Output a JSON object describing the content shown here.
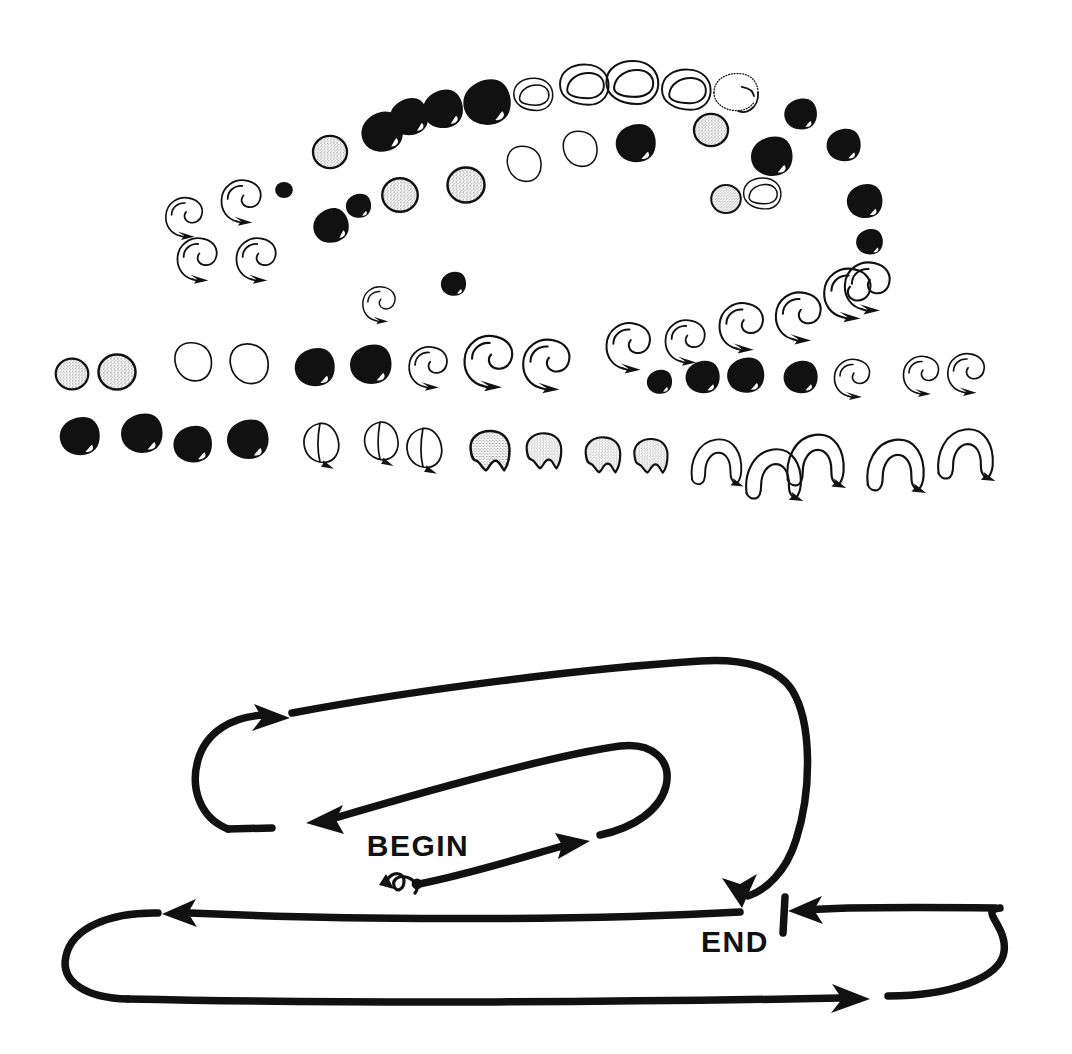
{
  "plate": {
    "title": "Serpentine glyph sequence plate",
    "background_color": "#ffffff",
    "ink_color": "#111111",
    "width": 1072,
    "height": 1054
  },
  "legend": {
    "begin_label": "BEGIN",
    "end_label": "END",
    "end_tick_mark": "|"
  },
  "glyph_kinds": {
    "solid": "solid-ink-blob",
    "stipple": "stippled-circle",
    "outline": "open-outline-blob",
    "crescent": "open-crescent",
    "crescent_dotted": "dotted-outline-crescent",
    "hook": "hook-with-arrow-tail",
    "arch": "open-arch-horseshoe",
    "teardrop": "outlined-teardrop-with-tail",
    "stipple_lobed": "stippled-lobed-blob",
    "dot": "small-solid-dot"
  },
  "chart_data": {
    "type": "scatter",
    "xlabel": "",
    "ylabel": "",
    "xlim": [
      0,
      1072
    ],
    "ylim": [
      0,
      1054
    ],
    "grid": false,
    "legend_position": "none",
    "rows": [
      {
        "row": 1,
        "name": "upper-arc-outer-left-ascending",
        "direction": "left-to-right ascending",
        "glyphs": [
          {
            "x": 183,
            "y": 216,
            "kind": "hook",
            "size": 26,
            "rot": 0
          },
          {
            "x": 196,
            "y": 258,
            "kind": "hook",
            "size": 28,
            "rot": 0
          },
          {
            "x": 240,
            "y": 200,
            "kind": "hook",
            "size": 28,
            "rot": 0
          },
          {
            "x": 255,
            "y": 258,
            "kind": "hook",
            "size": 28,
            "rot": 0
          },
          {
            "x": 284,
            "y": 190,
            "kind": "dot",
            "size": 13,
            "rot": 0
          },
          {
            "x": 330,
            "y": 152,
            "kind": "stipple",
            "size": 23,
            "rot": 0
          },
          {
            "x": 381,
            "y": 131,
            "kind": "solid",
            "size": 28,
            "rot": -12
          },
          {
            "x": 408,
            "y": 116,
            "kind": "solid",
            "size": 26,
            "rot": -10
          },
          {
            "x": 442,
            "y": 108,
            "kind": "solid",
            "size": 27,
            "rot": -8
          },
          {
            "x": 486,
            "y": 101,
            "kind": "solid",
            "size": 32,
            "rot": -5
          },
          {
            "x": 533,
            "y": 97,
            "kind": "crescent",
            "size": 24,
            "rot": 0
          },
          {
            "x": 584,
            "y": 88,
            "kind": "crescent",
            "size": 30,
            "rot": 0
          },
          {
            "x": 632,
            "y": 86,
            "kind": "crescent",
            "size": 32,
            "rot": 0
          },
          {
            "x": 686,
            "y": 93,
            "kind": "crescent",
            "size": 30,
            "rot": 0
          },
          {
            "x": 736,
            "y": 95,
            "kind": "crescent_dotted",
            "size": 29,
            "rot": 0
          },
          {
            "x": 800,
            "y": 113,
            "kind": "solid",
            "size": 22,
            "rot": 0
          },
          {
            "x": 843,
            "y": 144,
            "kind": "solid",
            "size": 23,
            "rot": 0
          },
          {
            "x": 864,
            "y": 200,
            "kind": "solid",
            "size": 24,
            "rot": 0
          },
          {
            "x": 869,
            "y": 241,
            "kind": "solid",
            "size": 18,
            "rot": 0
          },
          {
            "x": 866,
            "y": 285,
            "kind": "hook",
            "size": 32,
            "rot": 0
          }
        ]
      },
      {
        "row": 2,
        "name": "upper-arc-inner-left-ascending",
        "direction": "left-to-right ascending",
        "glyphs": [
          {
            "x": 330,
            "y": 225,
            "kind": "solid",
            "size": 24,
            "rot": -15
          },
          {
            "x": 358,
            "y": 205,
            "kind": "solid",
            "size": 17,
            "rot": 0
          },
          {
            "x": 400,
            "y": 195,
            "kind": "stipple",
            "size": 24,
            "rot": 0
          },
          {
            "x": 466,
            "y": 185,
            "kind": "stipple",
            "size": 25,
            "rot": 0
          },
          {
            "x": 524,
            "y": 164,
            "kind": "outline",
            "size": 24,
            "rot": 0
          },
          {
            "x": 580,
            "y": 149,
            "kind": "outline",
            "size": 24,
            "rot": 0
          },
          {
            "x": 635,
            "y": 142,
            "kind": "solid",
            "size": 27,
            "rot": 0
          },
          {
            "x": 711,
            "y": 130,
            "kind": "stipple",
            "size": 23,
            "rot": 0
          },
          {
            "x": 771,
            "y": 155,
            "kind": "solid",
            "size": 28,
            "rot": 0
          },
          {
            "x": 726,
            "y": 199,
            "kind": "stipple",
            "size": 20,
            "rot": 0
          },
          {
            "x": 762,
            "y": 196,
            "kind": "crescent",
            "size": 23,
            "rot": 0
          }
        ]
      },
      {
        "row": 3,
        "name": "middle-descending-left",
        "direction": "right-to-left descending",
        "glyphs": [
          {
            "x": 453,
            "y": 283,
            "kind": "solid",
            "size": 17,
            "rot": 0
          },
          {
            "x": 378,
            "y": 303,
            "kind": "hook",
            "size": 23,
            "rot": 0
          }
        ]
      },
      {
        "row": 4,
        "name": "middle-row-right-to-left-upper",
        "direction": "left-to-right",
        "glyphs": [
          {
            "x": 72,
            "y": 374,
            "kind": "stipple",
            "size": 22,
            "rot": 0
          },
          {
            "x": 117,
            "y": 372,
            "kind": "stipple",
            "size": 25,
            "rot": 0
          },
          {
            "x": 193,
            "y": 362,
            "kind": "outline",
            "size": 26,
            "rot": 0
          },
          {
            "x": 249,
            "y": 364,
            "kind": "outline",
            "size": 27,
            "rot": 0
          },
          {
            "x": 314,
            "y": 366,
            "kind": "solid",
            "size": 27,
            "rot": 0
          },
          {
            "x": 370,
            "y": 363,
            "kind": "solid",
            "size": 28,
            "rot": 0
          },
          {
            "x": 427,
            "y": 366,
            "kind": "hook",
            "size": 27,
            "rot": 0
          },
          {
            "x": 487,
            "y": 360,
            "kind": "hook",
            "size": 34,
            "rot": 0
          },
          {
            "x": 545,
            "y": 363,
            "kind": "hook",
            "size": 33,
            "rot": 0
          },
          {
            "x": 627,
            "y": 345,
            "kind": "hook",
            "size": 31,
            "rot": 0
          },
          {
            "x": 684,
            "y": 340,
            "kind": "hook",
            "size": 28,
            "rot": 0
          },
          {
            "x": 740,
            "y": 325,
            "kind": "hook",
            "size": 31,
            "rot": 0
          },
          {
            "x": 797,
            "y": 315,
            "kind": "hook",
            "size": 32,
            "rot": 0
          },
          {
            "x": 846,
            "y": 292,
            "kind": "hook",
            "size": 33,
            "rot": 0
          }
        ]
      },
      {
        "row": 5,
        "name": "middle-row-right-segment",
        "direction": "left-to-right",
        "glyphs": [
          {
            "x": 659,
            "y": 381,
            "kind": "solid",
            "size": 17,
            "rot": 0
          },
          {
            "x": 702,
            "y": 376,
            "kind": "solid",
            "size": 23,
            "rot": 0
          },
          {
            "x": 745,
            "y": 374,
            "kind": "solid",
            "size": 25,
            "rot": 0
          },
          {
            "x": 800,
            "y": 376,
            "kind": "solid",
            "size": 23,
            "rot": 0
          },
          {
            "x": 851,
            "y": 377,
            "kind": "hook",
            "size": 25,
            "rot": 0
          },
          {
            "x": 920,
            "y": 374,
            "kind": "hook",
            "size": 25,
            "rot": 0
          },
          {
            "x": 965,
            "y": 372,
            "kind": "hook",
            "size": 26,
            "rot": 0
          }
        ]
      },
      {
        "row": 6,
        "name": "bottom-row",
        "direction": "left-to-right",
        "glyphs": [
          {
            "x": 79,
            "y": 435,
            "kind": "solid",
            "size": 27,
            "rot": 0
          },
          {
            "x": 141,
            "y": 432,
            "kind": "solid",
            "size": 28,
            "rot": 0
          },
          {
            "x": 192,
            "y": 443,
            "kind": "solid",
            "size": 26,
            "rot": 0
          },
          {
            "x": 247,
            "y": 438,
            "kind": "solid",
            "size": 28,
            "rot": 0
          },
          {
            "x": 321,
            "y": 444,
            "kind": "teardrop",
            "size": 27,
            "rot": 0
          },
          {
            "x": 381,
            "y": 442,
            "kind": "teardrop",
            "size": 26,
            "rot": 0
          },
          {
            "x": 424,
            "y": 449,
            "kind": "teardrop",
            "size": 27,
            "rot": 0
          },
          {
            "x": 489,
            "y": 452,
            "kind": "stipple_lobed",
            "size": 27,
            "rot": 0
          },
          {
            "x": 543,
            "y": 452,
            "kind": "stipple_lobed",
            "size": 24,
            "rot": 0
          },
          {
            "x": 602,
            "y": 456,
            "kind": "stipple_lobed",
            "size": 24,
            "rot": 0
          },
          {
            "x": 650,
            "y": 457,
            "kind": "stipple_lobed",
            "size": 23,
            "rot": 0
          },
          {
            "x": 716,
            "y": 460,
            "kind": "arch",
            "size": 30,
            "rot": 0
          },
          {
            "x": 773,
            "y": 472,
            "kind": "arch",
            "size": 33,
            "rot": 0
          },
          {
            "x": 815,
            "y": 458,
            "kind": "arch",
            "size": 34,
            "rot": 0
          },
          {
            "x": 895,
            "y": 463,
            "kind": "arch",
            "size": 34,
            "rot": 0
          },
          {
            "x": 965,
            "y": 452,
            "kind": "arch",
            "size": 33,
            "rot": 0
          }
        ]
      }
    ],
    "reading_path": {
      "name": "boustrophedon-reading-order-diagram",
      "segments": [
        {
          "id": "start-mark",
          "shape": "small-squiggle",
          "x": 400,
          "y": 884
        },
        {
          "id": "seg1",
          "label": "BEGIN",
          "from": [
            415,
            884
          ],
          "to": [
            578,
            845
          ],
          "arrow": "right"
        },
        {
          "id": "seg2",
          "shape": "u-turn-right-inner",
          "arrow": "none"
        },
        {
          "id": "seg3",
          "from": [
            660,
            775
          ],
          "to": [
            300,
            830
          ],
          "arrow": "left"
        },
        {
          "id": "seg4",
          "shape": "u-turn-left-outer",
          "arrow": "none"
        },
        {
          "id": "seg5",
          "from": [
            285,
            718
          ],
          "to": [
            700,
            660
          ],
          "arrow": "right-at-left-end"
        },
        {
          "id": "seg6",
          "shape": "big-right-loop-down",
          "arrow": "down-left",
          "label": "END"
        },
        {
          "id": "seg7",
          "from": [
            1010,
            910
          ],
          "to": [
            800,
            908
          ],
          "arrow": "left"
        },
        {
          "id": "seg8",
          "shape": "bottom-left-u-turn",
          "arrow": "none"
        },
        {
          "id": "seg9",
          "from": [
            160,
            912
          ],
          "to": [
            150,
            912
          ],
          "arrow": "left"
        },
        {
          "id": "seg10",
          "from": [
            80,
            995
          ],
          "to": [
            870,
            993
          ],
          "arrow": "right"
        }
      ]
    }
  }
}
